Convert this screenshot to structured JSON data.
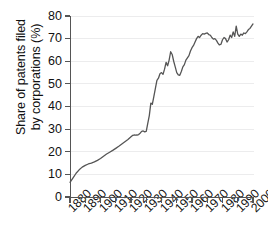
{
  "chart_data": {
    "type": "line",
    "title": "",
    "xlabel": "",
    "ylabel": "Share of patents filed by corporations (%)",
    "ylabel_line1": "Share of patents filed",
    "ylabel_line2": "by corporations (%)",
    "xlim": [
      1880,
      2000
    ],
    "ylim": [
      0,
      80
    ],
    "ytick_values": [
      0,
      10,
      20,
      30,
      40,
      50,
      60,
      70,
      80
    ],
    "ytick_labels": [
      "0",
      "10",
      "20",
      "30",
      "40",
      "50",
      "60",
      "70",
      "80"
    ],
    "xtick_values": [
      1880,
      1890,
      1900,
      1910,
      1920,
      1930,
      1940,
      1950,
      1960,
      1970,
      1980,
      1990,
      2000
    ],
    "xtick_labels": [
      "1880",
      "1890",
      "1900",
      "1910",
      "1920",
      "1930",
      "1940",
      "1950",
      "1960",
      "1970",
      "1980",
      "1990",
      "2000"
    ],
    "grid": true,
    "grid_color": "#ececed",
    "legend": null,
    "line_color": "#555555",
    "line_width": 1.3,
    "series": [
      {
        "name": "Share of patents filed by corporations",
        "x": [
          1880,
          1882,
          1884,
          1886,
          1888,
          1890,
          1892,
          1894,
          1896,
          1898,
          1900,
          1902,
          1904,
          1906,
          1908,
          1910,
          1912,
          1914,
          1916,
          1918,
          1920,
          1921,
          1922,
          1923,
          1924,
          1925,
          1926,
          1927,
          1928,
          1929,
          1930,
          1931,
          1932,
          1933,
          1934,
          1935,
          1936,
          1937,
          1938,
          1939,
          1940,
          1941,
          1942,
          1943,
          1944,
          1945,
          1946,
          1947,
          1948,
          1949,
          1950,
          1951,
          1952,
          1953,
          1954,
          1955,
          1956,
          1957,
          1958,
          1959,
          1960,
          1961,
          1962,
          1963,
          1964,
          1965,
          1966,
          1967,
          1968,
          1969,
          1970,
          1971,
          1972,
          1973,
          1974,
          1975,
          1976,
          1977,
          1978,
          1979,
          1980,
          1981,
          1982,
          1983,
          1984,
          1985,
          1986,
          1987,
          1988,
          1989,
          1990,
          1991,
          1992,
          1993,
          1994,
          1995,
          1996,
          1997,
          1998,
          1999,
          2000
        ],
        "values": [
          6.5,
          8.5,
          10.5,
          12.0,
          13.2,
          14.0,
          14.6,
          15.0,
          15.5,
          16.2,
          17.0,
          18.0,
          19.0,
          19.8,
          20.6,
          21.5,
          22.4,
          23.4,
          24.4,
          25.4,
          26.6,
          27.2,
          27.4,
          27.3,
          27.4,
          27.6,
          28.2,
          29.0,
          29.2,
          28.8,
          29.0,
          32.5,
          36.0,
          41.5,
          41.0,
          44.5,
          48.0,
          51.5,
          52.5,
          54.5,
          55.0,
          54.2,
          56.5,
          59.5,
          58.0,
          60.5,
          64.2,
          63.0,
          60.0,
          57.5,
          55.0,
          54.0,
          53.8,
          55.5,
          57.5,
          58.5,
          60.5,
          61.5,
          62.5,
          64.5,
          66.0,
          67.0,
          68.5,
          70.0,
          71.0,
          70.5,
          71.5,
          72.2,
          72.0,
          72.3,
          72.5,
          71.8,
          71.5,
          70.5,
          69.8,
          70.0,
          69.2,
          68.0,
          67.2,
          67.5,
          69.5,
          70.5,
          70.0,
          68.5,
          69.5,
          71.5,
          70.5,
          73.0,
          71.0,
          75.5,
          72.0,
          71.0,
          72.0,
          71.5,
          72.5,
          72.2,
          73.0,
          74.0,
          74.5,
          75.5,
          76.5
        ]
      }
    ]
  }
}
